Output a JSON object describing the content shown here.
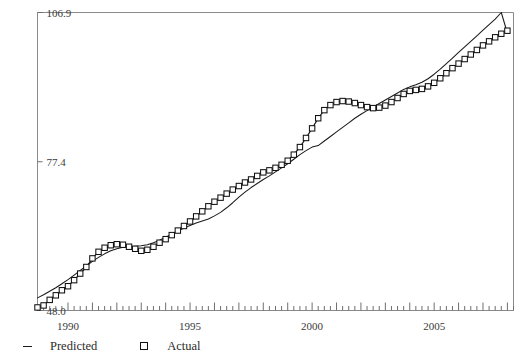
{
  "chart_data": {
    "type": "line",
    "title": "",
    "subtitle": "",
    "xlabel": "",
    "ylabel": "",
    "xlim": [
      1988.75,
      2008.25
    ],
    "ylim": [
      48.0,
      106.9
    ],
    "grid": false,
    "legend_position": "bottom-left",
    "y_ticks": [
      48.0,
      77.4,
      106.9
    ],
    "y_tick_labels": [
      "48.0",
      "77.4",
      "106.9"
    ],
    "x_ticks": [
      1990,
      1995,
      2000,
      2005
    ],
    "x_tick_labels": [
      "1990",
      "1995",
      "2000",
      "2005"
    ],
    "x_minor_tick_interval": 0.25,
    "legend": [
      {
        "name": "Predicted",
        "marker": "dash",
        "color": "#1a1a1a"
      },
      {
        "name": "Actual",
        "marker": "square",
        "color": "#111111"
      }
    ],
    "x": [
      1988.75,
      1989.0,
      1989.25,
      1989.5,
      1989.75,
      1990.0,
      1990.25,
      1990.5,
      1990.75,
      1991.0,
      1991.25,
      1991.5,
      1991.75,
      1992.0,
      1992.25,
      1992.5,
      1992.75,
      1993.0,
      1993.25,
      1993.5,
      1993.75,
      1994.0,
      1994.25,
      1994.5,
      1994.75,
      1995.0,
      1995.25,
      1995.5,
      1995.75,
      1996.0,
      1996.25,
      1996.5,
      1996.75,
      1997.0,
      1997.25,
      1997.5,
      1997.75,
      1998.0,
      1998.25,
      1998.5,
      1998.75,
      1999.0,
      1999.25,
      1999.5,
      1999.75,
      2000.0,
      2000.25,
      2000.5,
      2000.75,
      2001.0,
      2001.25,
      2001.5,
      2001.75,
      2002.0,
      2002.25,
      2002.5,
      2002.75,
      2003.0,
      2003.25,
      2003.5,
      2003.75,
      2004.0,
      2004.25,
      2004.5,
      2004.75,
      2005.0,
      2005.25,
      2005.5,
      2005.75,
      2006.0,
      2006.25,
      2006.5,
      2006.75,
      2007.0,
      2007.25,
      2007.5,
      2007.75,
      2008.0
    ],
    "series": [
      {
        "name": "Actual",
        "marker": "square",
        "values": [
          48.6,
          49.0,
          50.1,
          51.0,
          52.0,
          52.8,
          54.0,
          55.3,
          56.6,
          58.3,
          59.6,
          60.4,
          60.9,
          61.1,
          61.0,
          60.6,
          60.2,
          59.8,
          60.0,
          60.6,
          61.4,
          62.1,
          62.9,
          63.8,
          64.7,
          65.6,
          66.6,
          67.6,
          68.6,
          69.5,
          70.3,
          71.1,
          71.9,
          72.6,
          73.3,
          73.9,
          74.6,
          75.3,
          75.7,
          76.2,
          76.8,
          77.6,
          78.8,
          80.3,
          82.1,
          84.0,
          86.0,
          87.6,
          88.6,
          89.2,
          89.4,
          89.3,
          89.0,
          88.6,
          88.2,
          88.0,
          88.1,
          88.5,
          89.2,
          90.0,
          90.8,
          91.4,
          91.6,
          91.8,
          92.3,
          93.0,
          93.9,
          94.9,
          95.9,
          96.8,
          97.7,
          98.6,
          99.5,
          100.4,
          101.2,
          102.0,
          102.7,
          103.3
        ]
      },
      {
        "name": "Predicted",
        "marker": "dash",
        "values": [
          50.5,
          51.1,
          51.8,
          52.5,
          53.3,
          54.1,
          55.0,
          55.9,
          56.8,
          57.7,
          58.5,
          59.2,
          59.8,
          60.2,
          60.5,
          60.6,
          60.7,
          60.8,
          61.0,
          61.4,
          61.9,
          62.5,
          63.1,
          63.7,
          64.3,
          64.8,
          65.3,
          65.7,
          66.1,
          66.7,
          67.4,
          68.3,
          69.3,
          70.4,
          71.4,
          72.3,
          73.1,
          73.9,
          74.6,
          75.4,
          76.2,
          77.0,
          77.9,
          78.8,
          79.6,
          80.3,
          80.6,
          81.5,
          82.4,
          83.3,
          84.2,
          85.1,
          86.0,
          86.8,
          87.5,
          88.2,
          88.9,
          89.6,
          90.3,
          91.0,
          91.7,
          92.2,
          92.6,
          93.1,
          93.8,
          94.7,
          95.7,
          96.8,
          97.9,
          99.0,
          100.1,
          101.2,
          102.3,
          103.4,
          104.5,
          105.6,
          106.9,
          102.8
        ]
      }
    ]
  }
}
